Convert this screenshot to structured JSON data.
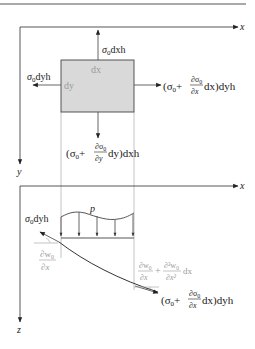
{
  "figure": {
    "top_rule_color": "#8c8c8c",
    "element_fill": "#d9d9d9",
    "element_stroke": "#444444"
  },
  "upper_panel": {
    "axis_x_label": "x",
    "axis_y_label": "y",
    "element": {
      "width_label": "dx",
      "height_label": "dy"
    },
    "forces": {
      "top": {
        "base": "σ",
        "sub": "0",
        "rest": "dxh"
      },
      "left": {
        "base": "σ",
        "sub": "0",
        "rest": "dyh"
      },
      "right": {
        "open": "(σ",
        "sub0": "0",
        "plus": "+",
        "num": "∂σ",
        "num_sub": "0",
        "den": "∂x",
        "after": "dx)dyh"
      },
      "bottom": {
        "open": "(σ",
        "sub0": "0",
        "plus": "+",
        "num": "∂σ",
        "num_sub": "0",
        "den": "∂y",
        "after": "dy)dxh"
      }
    }
  },
  "lower_panel": {
    "axis_x_label": "x",
    "axis_z_label": "z",
    "load_label": "p",
    "forces": {
      "left": {
        "base": "σ",
        "sub": "0",
        "rest": "dyh"
      },
      "right": {
        "open": "(σ",
        "sub0": "0",
        "plus": "+",
        "num": "∂σ",
        "num_sub": "0",
        "den": "∂x",
        "after": "dx)dyh"
      }
    },
    "slopes": {
      "left": {
        "num": "∂w",
        "num_sub": "0",
        "den": "∂x"
      },
      "right": {
        "num1": "∂w",
        "num1_sub": "0",
        "den1": "∂x",
        "plus": "+",
        "num2": "∂²w",
        "num2_sub": "0",
        "den2": "∂x²",
        "after": "dx"
      }
    }
  }
}
